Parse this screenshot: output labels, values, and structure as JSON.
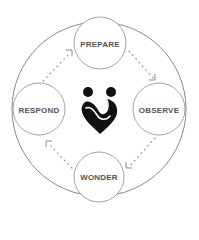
{
  "diagram": {
    "type": "cycle",
    "colors": {
      "stroke": "#8a8a8a",
      "text": "#555555",
      "logo": "#111111",
      "dots": "#9a9a9a"
    },
    "center_icon": "heart-people-logo-icon",
    "nodes": [
      {
        "id": "prepare",
        "label": "PREPARE",
        "cx": 100,
        "cy": 43
      },
      {
        "id": "observe",
        "label": "OBSERVE",
        "cx": 159,
        "cy": 109
      },
      {
        "id": "wonder",
        "label": "WONDER",
        "cx": 99,
        "cy": 177
      },
      {
        "id": "respond",
        "label": "RESPOND",
        "cx": 39,
        "cy": 109
      }
    ],
    "edges": [
      {
        "from": "prepare",
        "to": "observe"
      },
      {
        "from": "observe",
        "to": "wonder"
      },
      {
        "from": "wonder",
        "to": "respond"
      },
      {
        "from": "respond",
        "to": "prepare"
      }
    ]
  }
}
